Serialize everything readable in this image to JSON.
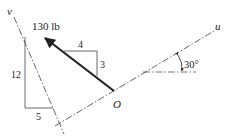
{
  "diagram": {
    "force": {
      "magnitude_label": "130 lb",
      "slope_run": "4",
      "slope_rise": "3"
    },
    "axes": {
      "u_label": "u",
      "v_label": "v",
      "origin_label": "O"
    },
    "v_axis_slope": {
      "rise": "12",
      "run": "5"
    },
    "angle": {
      "label": "30°"
    },
    "colors": {
      "line": "#222222",
      "dashed": "#555555"
    }
  }
}
